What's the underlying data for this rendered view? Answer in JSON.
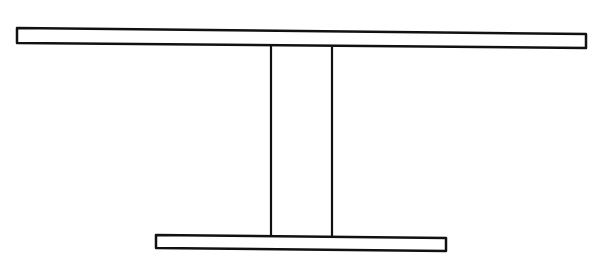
{
  "diagram": {
    "stroke_color": "#111111",
    "fill_color": "#ffffff",
    "parts": [
      {
        "name": "top-plank",
        "points": "17,28 586,34 586,48 17,43"
      },
      {
        "name": "column",
        "left_x": 271,
        "right_x": 332,
        "top_y": 46,
        "bottom_y": 236
      },
      {
        "name": "base-plank",
        "points": "156,235 446,238 446,251 156,248"
      }
    ]
  }
}
